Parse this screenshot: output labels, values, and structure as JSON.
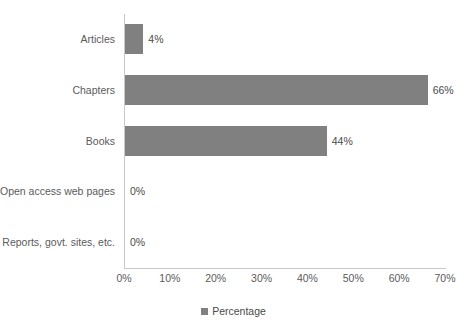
{
  "chart_data": {
    "type": "bar",
    "orientation": "horizontal",
    "title": "",
    "xlabel": "",
    "ylabel": "",
    "categories": [
      "Articles",
      "Chapters",
      "Books",
      "Open access web pages",
      "Reports, govt. sites, etc."
    ],
    "values": [
      4,
      66,
      44,
      0,
      0
    ],
    "data_labels": [
      "4%",
      "66%",
      "44%",
      "0%",
      "0%"
    ],
    "series": [
      {
        "name": "Percentage",
        "values": [
          4,
          66,
          44,
          0,
          0
        ],
        "color": "#808080"
      }
    ],
    "xlim": [
      0,
      70
    ],
    "xticks": [
      0,
      10,
      20,
      30,
      40,
      50,
      60,
      70
    ],
    "xtick_labels": [
      "0%",
      "10%",
      "20%",
      "30%",
      "40%",
      "50%",
      "60%",
      "70%"
    ],
    "grid": false,
    "legend": {
      "position": "bottom",
      "entries": [
        {
          "label": "Percentage",
          "color": "#808080"
        }
      ]
    },
    "colors": {
      "bar": "#808080",
      "axis_line": "#c9c9c9",
      "tick_text": "#5b5b5b",
      "label_text": "#5b5b5b",
      "value_text": "#4a4a4a",
      "background": "#ffffff"
    }
  }
}
